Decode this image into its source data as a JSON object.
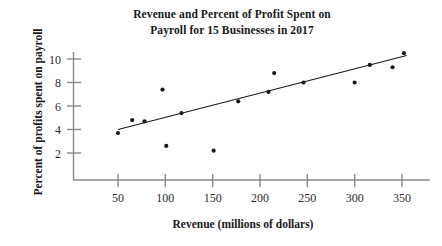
{
  "chart_data": {
    "type": "scatter",
    "title": "Revenue and Percent of Profit Spent on Payroll for 15 Businesses in 2017",
    "title_line1": "Revenue and Percent of Profit Spent on",
    "title_line2": "Payroll for 15 Businesses in 2017",
    "xlabel": "Revenue (millions of dollars)",
    "ylabel": "Percent of profits spent on payroll",
    "xlim": [
      0,
      375
    ],
    "ylim": [
      0,
      11.5
    ],
    "xticks": [
      50,
      100,
      150,
      200,
      250,
      300,
      350
    ],
    "yticks": [
      2,
      4,
      6,
      8,
      10
    ],
    "xtick_labels": [
      "50",
      "100",
      "150",
      "200",
      "250",
      "300",
      "350"
    ],
    "ytick_labels": [
      "2",
      "4",
      "6",
      "8",
      "10"
    ],
    "grid": false,
    "legend": "none",
    "marker_color": "#1a1a1a",
    "line_color": "#1a1a1a",
    "axis_color": "#808080",
    "points": [
      {
        "x": 50,
        "y": 3.7
      },
      {
        "x": 65,
        "y": 4.8
      },
      {
        "x": 78,
        "y": 4.7
      },
      {
        "x": 97,
        "y": 7.4
      },
      {
        "x": 101,
        "y": 2.6
      },
      {
        "x": 117,
        "y": 5.4
      },
      {
        "x": 151,
        "y": 2.2
      },
      {
        "x": 177,
        "y": 6.4
      },
      {
        "x": 209,
        "y": 7.2
      },
      {
        "x": 215,
        "y": 8.8
      },
      {
        "x": 246,
        "y": 8.0
      },
      {
        "x": 300,
        "y": 8.0
      },
      {
        "x": 316,
        "y": 9.5
      },
      {
        "x": 340,
        "y": 9.3
      },
      {
        "x": 352,
        "y": 10.5
      }
    ],
    "trend_line": {
      "name": "line of best fit",
      "x_start": 50,
      "y_start": 4.0,
      "x_end": 355,
      "y_end": 10.3
    }
  }
}
